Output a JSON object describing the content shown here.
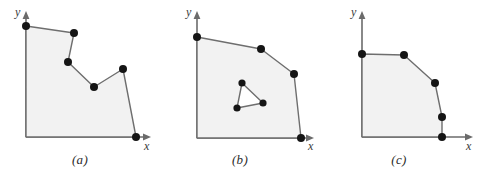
{
  "figure": {
    "background_color": "#ffffff",
    "polygon_fill_color": "#f2f2f2",
    "polygon_stroke_color": "#6e6e6e",
    "vertex_color": "#151515",
    "axis_color": "#6b6b6b",
    "hole_fill_color": "#ffffff"
  },
  "panels": [
    {
      "id": "a",
      "caption": "(a)",
      "x_axis_label": "x",
      "y_axis_label": "y",
      "shape_type": "non-convex-polygon",
      "has_hole": false,
      "origin": [
        26,
        137
      ],
      "axis": {
        "y_top": [
          26,
          14
        ],
        "x_right": [
          150,
          137
        ]
      },
      "outline": [
        [
          26,
          26
        ],
        [
          74,
          33
        ],
        [
          68,
          62
        ],
        [
          94,
          87
        ],
        [
          123,
          69
        ],
        [
          136,
          137
        ],
        [
          26,
          137
        ]
      ],
      "vertices": [
        [
          26,
          26
        ],
        [
          74,
          33
        ],
        [
          68,
          62
        ],
        [
          94,
          87
        ],
        [
          123,
          69
        ],
        [
          136,
          137
        ]
      ]
    },
    {
      "id": "b",
      "caption": "(b)",
      "x_axis_label": "x",
      "y_axis_label": "y",
      "shape_type": "convex-polygon-with-triangular-hole",
      "has_hole": true,
      "origin": [
        37,
        138
      ],
      "axis": {
        "y_top": [
          37,
          14
        ],
        "x_right": [
          153,
          138
        ]
      },
      "outline": [
        [
          37,
          37
        ],
        [
          101,
          49
        ],
        [
          134,
          74
        ],
        [
          141,
          138
        ],
        [
          37,
          138
        ]
      ],
      "vertices": [
        [
          37,
          37
        ],
        [
          101,
          49
        ],
        [
          134,
          74
        ],
        [
          141,
          138
        ]
      ],
      "hole": [
        [
          82,
          83
        ],
        [
          103,
          103
        ],
        [
          77,
          108
        ]
      ],
      "hole_vertices": [
        [
          82,
          83
        ],
        [
          103,
          103
        ],
        [
          77,
          108
        ]
      ]
    },
    {
      "id": "c",
      "caption": "(c)",
      "x_axis_label": "x",
      "y_axis_label": "y",
      "shape_type": "convex-polygon",
      "has_hole": false,
      "origin": [
        42,
        137
      ],
      "axis": {
        "y_top": [
          42,
          14
        ],
        "x_right": [
          152,
          137
        ]
      },
      "outline": [
        [
          42,
          54
        ],
        [
          84,
          55
        ],
        [
          115,
          83
        ],
        [
          122,
          117
        ],
        [
          122,
          137
        ],
        [
          42,
          137
        ]
      ],
      "vertices": [
        [
          42,
          54
        ],
        [
          84,
          55
        ],
        [
          115,
          83
        ],
        [
          122,
          117
        ],
        [
          122,
          137
        ]
      ]
    }
  ]
}
